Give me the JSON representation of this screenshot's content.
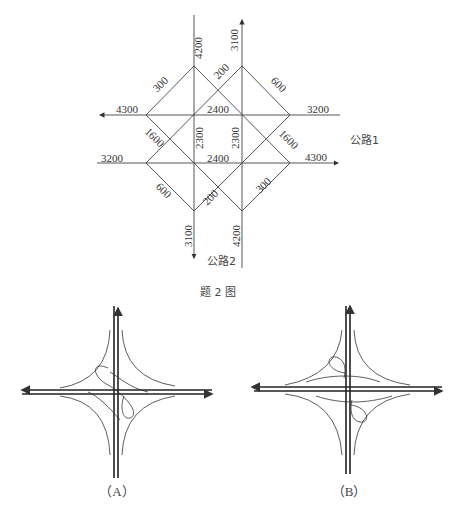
{
  "figure": {
    "caption": "题 2 图",
    "road1_label": "公路1",
    "road2_label": "公路2"
  },
  "flow_diagram": {
    "edges": {
      "north_in": "4200",
      "north_out": "3100",
      "west_out": "4300",
      "west_in": "3200",
      "east_in": "3200",
      "east_out": "4300",
      "south_out": "3100",
      "south_in": "4200",
      "diag_nw_top": "300",
      "diag_ne_inner": "200",
      "diag_ne_top": "600",
      "diag_sw_top": "1600",
      "diag_se_right": "1600",
      "diag_sw_bottom": "600",
      "diag_sc_inner": "200",
      "diag_se_bottom": "300",
      "horiz_top_mid": "2400",
      "horiz_bot_mid": "2400",
      "vert_left_mid": "2300",
      "vert_right_mid": "2300"
    }
  },
  "options": [
    {
      "label": "（A）"
    },
    {
      "label": "（B）"
    }
  ]
}
